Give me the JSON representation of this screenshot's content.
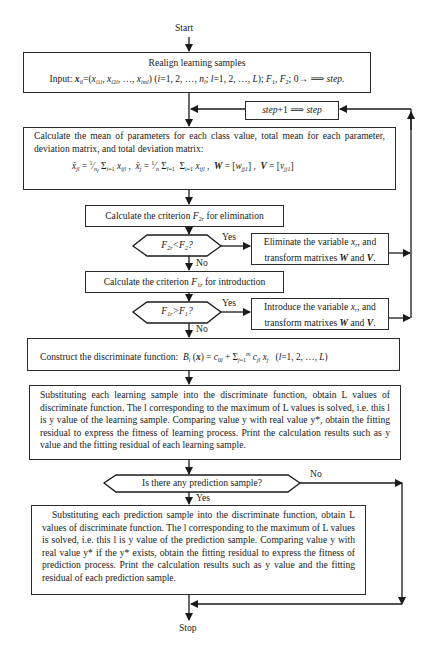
{
  "terminals": {
    "start": "Start",
    "stop": "Stop"
  },
  "box_realign": {
    "title": "Realign learning samples",
    "input_line": "Input: x_il =(x_i1l, x_i2l, …, x_iml) (i=1, 2, …, n_l; l=1, 2, …, L); F1, F2; 0→ ⟹ step."
  },
  "box_step": {
    "label": "step+1 ⟹ step"
  },
  "box_mean": {
    "text": "Calculate the mean of parameters for each class value, total mean for each parameter, deviation matrix, and total deviation matrix:",
    "formula": "x̄_jl = (1/n_l) Σ_{i=1}^{n_l} x_ijl ,  x̄_j = (1/n) Σ_{l=1}^{L} Σ_{i=1}^{n_l} x_ijl ,  W = [w_jj1],  V = [v_jj1]"
  },
  "box_criterion_f2": {
    "text": "Calculate the criterion F2r for elimination"
  },
  "decision_f2": {
    "text": "F2r<F2?",
    "yes": "Yes",
    "no": "No"
  },
  "box_eliminate": {
    "text": "Eliminate the variable xr, and transform matrixes W and V."
  },
  "box_criterion_f1": {
    "text": "Calculate the criterion F1r for introduction"
  },
  "decision_f1": {
    "text": "F1r>F1?",
    "yes": "Yes",
    "no": "No"
  },
  "box_introduce": {
    "text": "Introduce the variable xr, and transform matrixes W and V."
  },
  "box_construct": {
    "label": "Construct the discriminate function:",
    "formula": "B_l(x) = c_0l + Σ_{j=1}^{m} c_jl x_j   (l=1, 2, …, L)"
  },
  "box_learning": {
    "text": "Substituting each learning sample into the discriminate function, obtain L values of discriminate function. The l corresponding to the maximum of L values is solved, i.e. this l is y value of the learning sample. Comparing value y with real value y*, obtain the fitting residual to express the fitness of learning process. Print the calculation results such as y value and the fitting residual of each learning sample."
  },
  "decision_prediction": {
    "text": "Is there any prediction sample?",
    "yes": "Yes",
    "no": "No"
  },
  "box_prediction": {
    "text": "Substituting each prediction sample into the discriminate function, obtain L values of discriminate function. The l corresponding to the maximum of L values is solved, i.e. this l is y value of the prediction sample. Comparing value y with real value y* if the y* exists, obtain the fitting residual to express the fitness of prediction process. Print the calculation results such as y value and the fitting residual of each prediction sample."
  },
  "colors": {
    "line": "#1a1a1a",
    "background": "#ffffff"
  }
}
